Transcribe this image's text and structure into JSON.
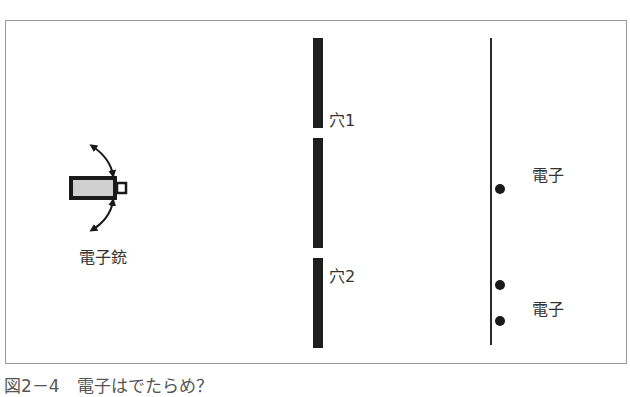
{
  "figure": {
    "caption": "図2－4　電子はでたらめ？",
    "gun_label": "電子銃",
    "slit_labels": [
      "穴1",
      "穴2"
    ],
    "electron_labels": [
      "電子",
      "電子"
    ],
    "colors": {
      "frame": "#9a9a9a",
      "barrier": "#1e1e1e",
      "screen": "#2a2a2a",
      "gun_body_fill": "#cfcfcf",
      "electron": "#1a1a1a"
    }
  }
}
